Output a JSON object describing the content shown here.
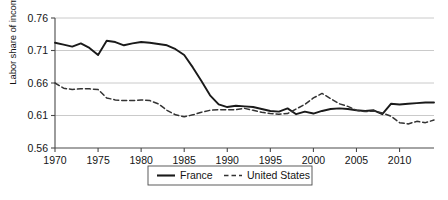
{
  "chart_data": {
    "type": "line",
    "title": "",
    "xlabel": "",
    "ylabel": "Labor share of income",
    "xlim": [
      1970,
      2014
    ],
    "ylim": [
      0.56,
      0.76
    ],
    "grid": true,
    "legend_position": "bottom",
    "xticks": [
      "1970",
      "1975",
      "1980",
      "1985",
      "1990",
      "1995",
      "2000",
      "2005",
      "2010"
    ],
    "xtick_values": [
      1970,
      1975,
      1980,
      1985,
      1990,
      1995,
      2000,
      2005,
      2010
    ],
    "yticks": [
      "0.56",
      "0.61",
      "0.66",
      "0.71",
      "0.76"
    ],
    "ytick_values": [
      0.56,
      0.61,
      0.66,
      0.71,
      0.76
    ],
    "x": [
      1970,
      1971,
      1972,
      1973,
      1974,
      1975,
      1976,
      1977,
      1978,
      1979,
      1980,
      1981,
      1982,
      1983,
      1984,
      1985,
      1986,
      1987,
      1988,
      1989,
      1990,
      1991,
      1992,
      1993,
      1994,
      1995,
      1996,
      1997,
      1998,
      1999,
      2000,
      2001,
      2002,
      2003,
      2004,
      2005,
      2006,
      2007,
      2008,
      2009,
      2010,
      2011,
      2012,
      2013,
      2014
    ],
    "series": [
      {
        "name": "France",
        "style": "solid",
        "color": "#1a1a1a",
        "values": [
          0.722,
          0.719,
          0.716,
          0.721,
          0.714,
          0.703,
          0.725,
          0.723,
          0.718,
          0.721,
          0.723,
          0.722,
          0.72,
          0.718,
          0.712,
          0.703,
          0.684,
          0.663,
          0.641,
          0.627,
          0.623,
          0.625,
          0.624,
          0.623,
          0.62,
          0.617,
          0.616,
          0.621,
          0.612,
          0.616,
          0.613,
          0.617,
          0.62,
          0.621,
          0.62,
          0.618,
          0.617,
          0.618,
          0.612,
          0.628,
          0.627,
          0.628,
          0.629,
          0.63,
          0.63
        ]
      },
      {
        "name": "United States",
        "style": "dashed",
        "color": "#333333",
        "values": [
          0.66,
          0.652,
          0.65,
          0.651,
          0.651,
          0.65,
          0.637,
          0.634,
          0.633,
          0.633,
          0.634,
          0.633,
          0.628,
          0.618,
          0.611,
          0.608,
          0.611,
          0.615,
          0.618,
          0.619,
          0.619,
          0.619,
          0.621,
          0.618,
          0.615,
          0.613,
          0.612,
          0.613,
          0.62,
          0.627,
          0.637,
          0.644,
          0.636,
          0.628,
          0.624,
          0.618,
          0.616,
          0.617,
          0.614,
          0.609,
          0.599,
          0.597,
          0.601,
          0.599,
          0.603
        ]
      }
    ]
  },
  "legend": {
    "items": [
      {
        "label": "France",
        "style": "solid"
      },
      {
        "label": "United States",
        "style": "dashed"
      }
    ]
  }
}
